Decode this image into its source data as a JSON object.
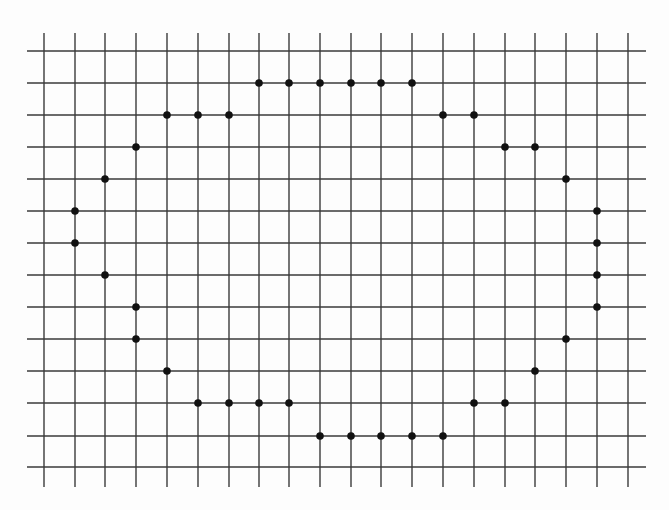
{
  "diagram": {
    "type": "dot-grid-shape",
    "colors": {
      "background": "#fdfdfd",
      "grid_line": "#3a3a3a",
      "dot": "#111111"
    },
    "grid": {
      "columns_x": [
        44,
        75,
        105,
        136,
        167,
        198,
        229,
        259,
        289,
        320,
        351,
        381,
        412,
        443,
        474,
        505,
        535,
        566,
        597,
        628
      ],
      "rows_y": [
        51,
        83,
        115,
        147,
        179,
        211,
        243,
        275,
        307,
        339,
        371,
        403,
        436,
        467
      ],
      "vertical_line_span": [
        33,
        487
      ],
      "horizontal_line_span": [
        27,
        646
      ],
      "line_width": 1.4
    },
    "dot_radius": 3.8,
    "dots": [
      [
        1,
        7
      ],
      [
        1,
        8
      ],
      [
        1,
        9
      ],
      [
        1,
        10
      ],
      [
        1,
        11
      ],
      [
        1,
        12
      ],
      [
        2,
        4
      ],
      [
        2,
        5
      ],
      [
        2,
        6
      ],
      [
        2,
        13
      ],
      [
        2,
        14
      ],
      [
        3,
        3
      ],
      [
        3,
        15
      ],
      [
        3,
        16
      ],
      [
        4,
        2
      ],
      [
        4,
        17
      ],
      [
        5,
        1
      ],
      [
        5,
        18
      ],
      [
        6,
        1
      ],
      [
        6,
        18
      ],
      [
        7,
        2
      ],
      [
        7,
        18
      ],
      [
        8,
        3
      ],
      [
        8,
        18
      ],
      [
        9,
        3
      ],
      [
        9,
        17
      ],
      [
        10,
        4
      ],
      [
        10,
        16
      ],
      [
        11,
        5
      ],
      [
        11,
        6
      ],
      [
        11,
        7
      ],
      [
        11,
        8
      ],
      [
        11,
        14
      ],
      [
        11,
        15
      ],
      [
        12,
        9
      ],
      [
        12,
        10
      ],
      [
        12,
        11
      ],
      [
        12,
        12
      ],
      [
        12,
        13
      ]
    ],
    "dot_count": 39,
    "grid_size": {
      "columns": 20,
      "rows": 14
    }
  }
}
